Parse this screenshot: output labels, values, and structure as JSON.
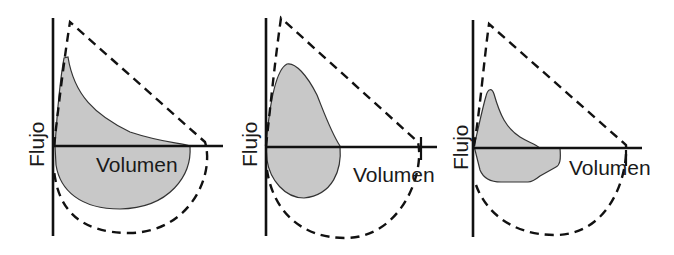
{
  "figure": {
    "panels": [
      {
        "id": "panel-1",
        "y_axis_label": "Flujo",
        "x_axis_label": "Volumen"
      },
      {
        "id": "panel-2",
        "y_axis_label": "Flujo",
        "x_axis_label": "Volumen"
      },
      {
        "id": "panel-3",
        "y_axis_label": "Flujo",
        "x_axis_label": "Volumen"
      }
    ]
  },
  "colors": {
    "loop_fill": "#c8c8c8",
    "line": "#111111",
    "background": "#ffffff"
  }
}
